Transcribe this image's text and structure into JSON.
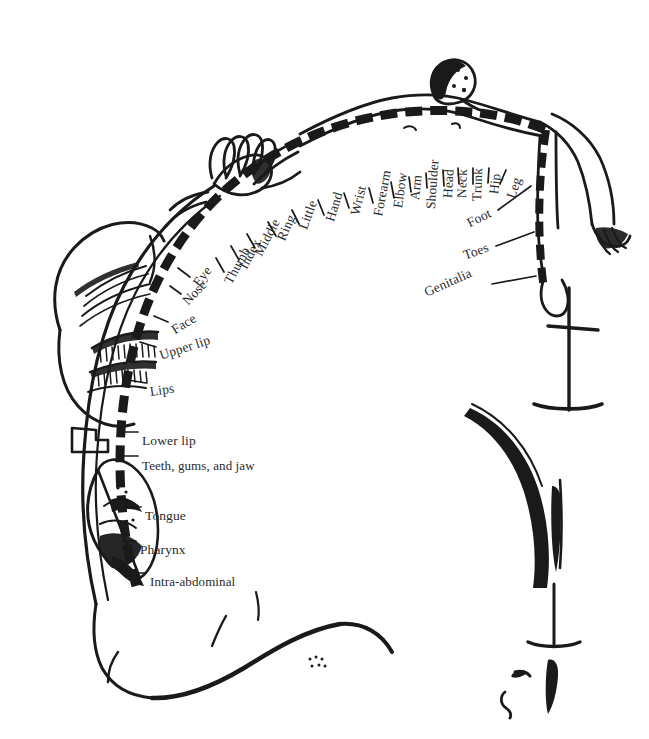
{
  "figure": {
    "background_color": "#ffffff",
    "ink_color": "#1a1a1a",
    "label_color": "#2b2b2b"
  },
  "labels": [
    {
      "id": "thumb",
      "text": "Thumb",
      "x": 228,
      "y": 275,
      "rotate": -62
    },
    {
      "id": "index",
      "text": "Index",
      "x": 243,
      "y": 260,
      "rotate": -62
    },
    {
      "id": "middle",
      "text": "Middle",
      "x": 258,
      "y": 247,
      "rotate": -62
    },
    {
      "id": "ring",
      "text": "Ring",
      "x": 281,
      "y": 232,
      "rotate": -66
    },
    {
      "id": "little",
      "text": "Little",
      "x": 303,
      "y": 221,
      "rotate": -70
    },
    {
      "id": "hand",
      "text": "Hand",
      "x": 330,
      "y": 213,
      "rotate": -73
    },
    {
      "id": "wrist",
      "text": "Wrist",
      "x": 355,
      "y": 207,
      "rotate": -76
    },
    {
      "id": "forearm",
      "text": "Forearm",
      "x": 378,
      "y": 208,
      "rotate": -79
    },
    {
      "id": "elbow",
      "text": "Elbow",
      "x": 398,
      "y": 200,
      "rotate": -82
    },
    {
      "id": "arm",
      "text": "Arm",
      "x": 415,
      "y": 192,
      "rotate": -84
    },
    {
      "id": "shoulder",
      "text": "Shoulder",
      "x": 431,
      "y": 201,
      "rotate": -86
    },
    {
      "id": "head",
      "text": "Head",
      "x": 448,
      "y": 190,
      "rotate": -87
    },
    {
      "id": "neck",
      "text": "Neck",
      "x": 462,
      "y": 190,
      "rotate": -88
    },
    {
      "id": "trunk",
      "text": "Trunk",
      "x": 477,
      "y": 193,
      "rotate": -88
    },
    {
      "id": "hip",
      "text": "Hip",
      "x": 494,
      "y": 186,
      "rotate": -83
    },
    {
      "id": "leg",
      "text": "Leg",
      "x": 511,
      "y": 190,
      "rotate": -72
    },
    {
      "id": "foot",
      "text": "Foot",
      "x": 468,
      "y": 216,
      "rotate": -27
    },
    {
      "id": "toes",
      "text": "Toes",
      "x": 464,
      "y": 248,
      "rotate": -20
    },
    {
      "id": "genitalia",
      "text": "Genitalia",
      "x": 425,
      "y": 285,
      "rotate": -24
    },
    {
      "id": "eye",
      "text": "Eye",
      "x": 196,
      "y": 277,
      "rotate": -52
    },
    {
      "id": "nose",
      "text": "Nose",
      "x": 185,
      "y": 295,
      "rotate": -46
    },
    {
      "id": "face",
      "text": "Face",
      "x": 173,
      "y": 323,
      "rotate": -32
    },
    {
      "id": "upper-lip",
      "text": "Upper lip",
      "x": 160,
      "y": 348,
      "rotate": -18
    },
    {
      "id": "lips",
      "text": "Lips",
      "x": 150,
      "y": 384,
      "rotate": -8
    },
    {
      "id": "lower-lip",
      "text": "Lower lip",
      "x": 142,
      "y": 433,
      "rotate": 0
    },
    {
      "id": "teeth",
      "text": "Teeth, gums, and jaw",
      "x": 142,
      "y": 458,
      "rotate": 0
    },
    {
      "id": "tongue",
      "text": "Tongue",
      "x": 145,
      "y": 508,
      "rotate": 0
    },
    {
      "id": "pharynx",
      "text": "Pharynx",
      "x": 140,
      "y": 542,
      "rotate": 0
    },
    {
      "id": "intra",
      "text": "Intra-abdominal",
      "x": 150,
      "y": 574,
      "rotate": 0
    }
  ]
}
